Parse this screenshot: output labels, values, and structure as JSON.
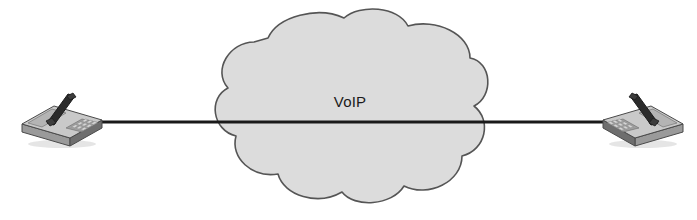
{
  "diagram": {
    "type": "network-topology",
    "title": "VoIP",
    "width": 697,
    "height": 220,
    "background_color": "#ffffff"
  },
  "cloud": {
    "label": "VoIP",
    "fill_color": "#dcdcdc",
    "stroke_color": "#555555",
    "label_color": "#1a1a1a",
    "label_x": 350,
    "label_y": 107,
    "bounds": {
      "left": 213,
      "top": 14,
      "right": 487,
      "bottom": 205
    }
  },
  "link": {
    "name": "connection-line",
    "color": "#1a1a1a",
    "thickness": 3,
    "y": 122,
    "x_start": 90,
    "x_end": 612
  },
  "endpoints": [
    {
      "id": "phone-left",
      "name": "ip-phone-left",
      "side": "left",
      "x": 18,
      "y": 88,
      "width": 84,
      "height": 58,
      "mirrored": false
    },
    {
      "id": "phone-right",
      "name": "ip-phone-right",
      "side": "right",
      "x": 603,
      "y": 88,
      "width": 84,
      "height": 58,
      "mirrored": true
    }
  ],
  "colors": {
    "phone_top": "#c9c9c9",
    "phone_top_light": "#d8d8d8",
    "phone_front": "#9a9a9a",
    "phone_side": "#6e6e6e",
    "phone_dark": "#3a3a3a",
    "handset": "#2b2b2b",
    "keypad": "#8a8a8a",
    "outline": "#4a4a4a",
    "shadow": "#b5b5b5"
  }
}
